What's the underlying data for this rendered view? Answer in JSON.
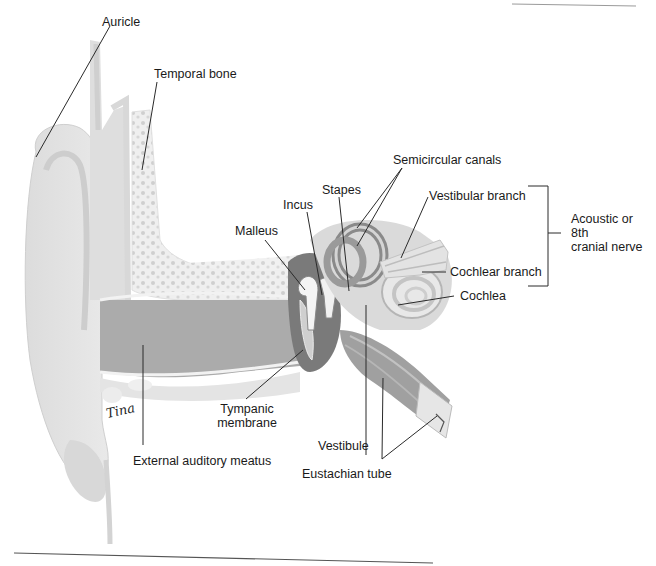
{
  "figure": {
    "signature": "Tina",
    "colors": {
      "background": "#ffffff",
      "skin_light": "#e6e6e6",
      "skin_mid": "#d2d2d2",
      "canal_dark": "#a9a9a9",
      "bone_fill": "#efefef",
      "bone_dots": "#c8c8c8",
      "ossicle_dark": "#7d7d7d",
      "leader_line": "#2a2a2a",
      "rule_line": "#555555"
    }
  },
  "labels": {
    "auricle": "Auricle",
    "temporal_bone": "Temporal bone",
    "semicircular_canals": "Semicircular canals",
    "stapes": "Stapes",
    "incus": "Incus",
    "malleus": "Malleus",
    "vestibular_branch": "Vestibular branch",
    "acoustic_nerve_line1": "Acoustic or",
    "acoustic_nerve_line2": "8th",
    "acoustic_nerve_line3": "cranial nerve",
    "cochlear_branch": "Cochlear branch",
    "cochlea": "Cochlea",
    "tympanic_membrane_line1": "Tympanic",
    "tympanic_membrane_line2": "membrane",
    "vestibule": "Vestibule",
    "external_auditory_meatus": "External auditory meatus",
    "eustachian_tube": "Eustachian tube"
  }
}
